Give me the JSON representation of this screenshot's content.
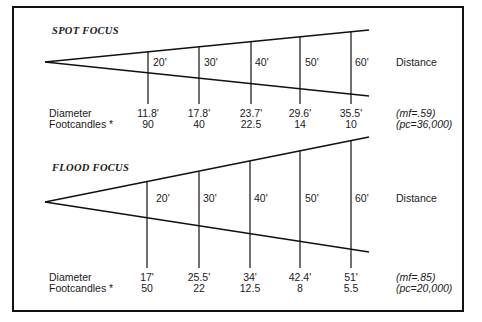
{
  "diagrams": [
    {
      "title": "SPOT FOCUS",
      "distance_label": "Distance",
      "distances": [
        "20'",
        "30'",
        "40'",
        "50'",
        "60'"
      ],
      "row_labels": {
        "diameter": "Diameter",
        "footcandles": "Footcandles *"
      },
      "diameters": [
        "11.8'",
        "17.8'",
        "23.7'",
        "29.6'",
        "35.5'"
      ],
      "footcandles": [
        "90",
        "40",
        "22.5",
        "14",
        "10"
      ],
      "notes": {
        "mf": "(mf=.59)",
        "pc": "(pc=36,000)"
      }
    },
    {
      "title": "FLOOD FOCUS",
      "distance_label": "Distance",
      "distances": [
        "20'",
        "30'",
        "40'",
        "50'",
        "60'"
      ],
      "row_labels": {
        "diameter": "Diameter",
        "footcandles": "Footcandles *"
      },
      "diameters": [
        "17'",
        "25.5'",
        "34'",
        "42.4'",
        "51'"
      ],
      "footcandles": [
        "50",
        "22",
        "12.5",
        "8",
        "5.5"
      ],
      "notes": {
        "mf": "(mf=.85)",
        "pc": "(pc=20,000)"
      }
    }
  ],
  "colors": {
    "line": "#111111",
    "text": "#1a1a1a",
    "background": "#ffffff"
  }
}
